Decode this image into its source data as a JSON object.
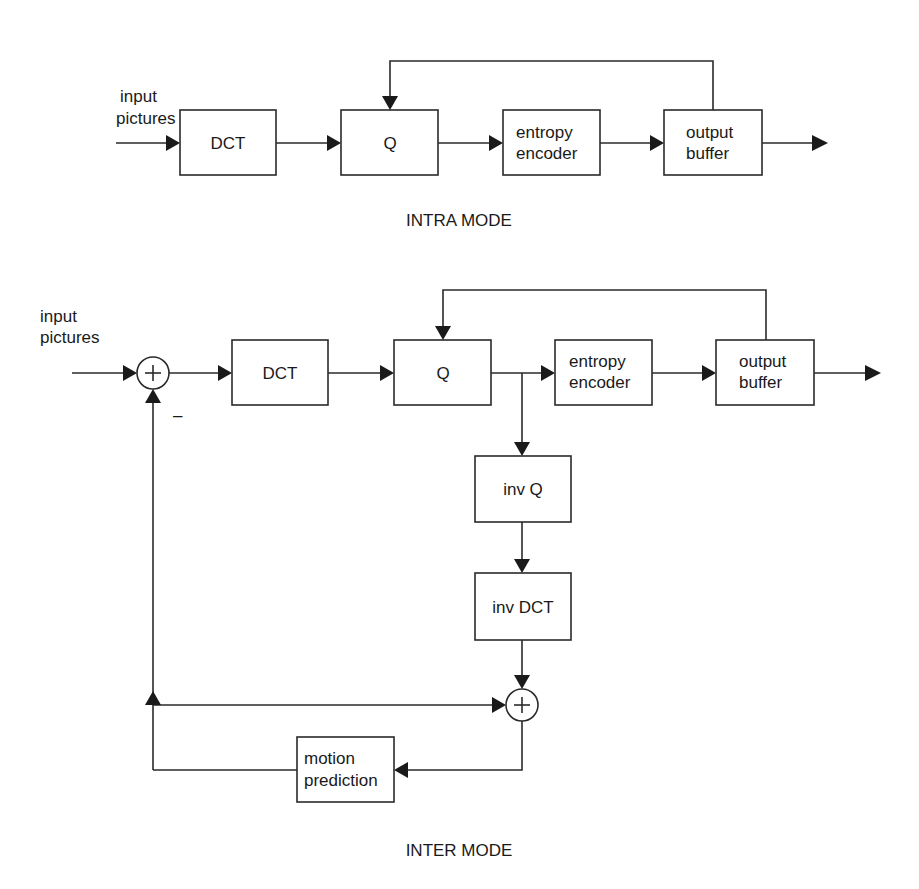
{
  "intra": {
    "input_label_1": "input",
    "input_label_2": "pictures",
    "blocks": {
      "dct": "DCT",
      "q": "Q",
      "entropy_1": "entropy",
      "entropy_2": "encoder",
      "buffer_1": "output",
      "buffer_2": "buffer"
    },
    "caption": "INTRA MODE"
  },
  "inter": {
    "input_label_1": "input",
    "input_label_2": "pictures",
    "minus_sign": "–",
    "plus_sign": "+",
    "blocks": {
      "dct": "DCT",
      "q": "Q",
      "entropy_1": "entropy",
      "entropy_2": "encoder",
      "buffer_1": "output",
      "buffer_2": "buffer",
      "inv_q": "inv Q",
      "inv_dct": "inv DCT",
      "motion_1": "motion",
      "motion_2": "prediction"
    },
    "caption": "INTER MODE"
  }
}
